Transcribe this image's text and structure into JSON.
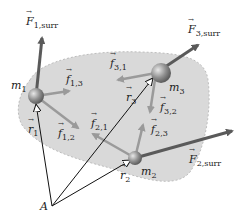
{
  "diagram": {
    "colors": {
      "region_fill": "#d9d9d9",
      "region_border": "#bdbdbd",
      "external_force": "#5a5a5a",
      "internal_force": "#9a9a9a",
      "position_vector": "#111111",
      "mass": "#8a8a8a"
    },
    "masses": [
      {
        "id": "m1",
        "name": "m",
        "sub": "1"
      },
      {
        "id": "m2",
        "name": "m",
        "sub": "2"
      },
      {
        "id": "m3",
        "name": "m",
        "sub": "3"
      }
    ],
    "external_forces": [
      {
        "name": "F",
        "sub": "1,surr"
      },
      {
        "name": "F",
        "sub": "2,surr"
      },
      {
        "name": "F",
        "sub": "3,surr"
      }
    ],
    "internal_forces": [
      {
        "name": "f",
        "sub": "1,3"
      },
      {
        "name": "f",
        "sub": "1,2"
      },
      {
        "name": "f",
        "sub": "2,1"
      },
      {
        "name": "f",
        "sub": "2,3"
      },
      {
        "name": "f",
        "sub": "3,1"
      },
      {
        "name": "f",
        "sub": "3,2"
      }
    ],
    "position_vectors": [
      {
        "name": "r",
        "sub": "1"
      },
      {
        "name": "r",
        "sub": "2"
      },
      {
        "name": "r",
        "sub": "3"
      }
    ],
    "origin_label": "A"
  }
}
